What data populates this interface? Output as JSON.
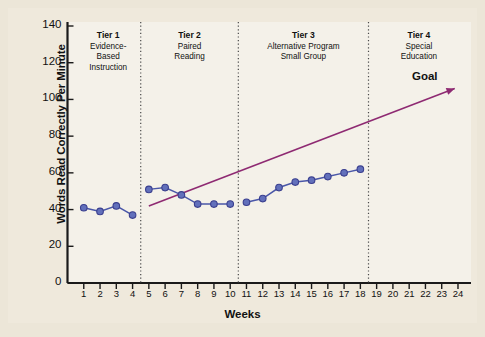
{
  "chart_data": {
    "type": "line",
    "title": "",
    "xlabel": "Weeks",
    "ylabel": "Words Read Correctly Per Minute",
    "xlim": [
      0,
      24.8
    ],
    "ylim": [
      0,
      140
    ],
    "ytick_values": [
      0,
      20,
      40,
      60,
      80,
      100,
      120,
      140
    ],
    "ytick_labels": [
      "0",
      "20",
      "40",
      "60",
      "80",
      "100",
      "120",
      "140"
    ],
    "xtick_values": [
      1,
      2,
      3,
      4,
      5,
      6,
      7,
      8,
      9,
      10,
      11,
      12,
      13,
      14,
      15,
      16,
      17,
      18,
      19,
      20,
      21,
      22,
      23,
      24
    ],
    "xtick_labels": [
      "1",
      "2",
      "3",
      "4",
      "5",
      "6",
      "7",
      "8",
      "9",
      "10",
      "11",
      "12",
      "13",
      "14",
      "15",
      "16",
      "17",
      "18",
      "19",
      "20",
      "21",
      "22",
      "23",
      "24"
    ],
    "grid": false,
    "legend": "none",
    "marker_color": "#6270bb",
    "marker_edge_color": "#3a3f8f",
    "line_color": "#4a57a8",
    "goal_line_color": "#8e2a72",
    "phase_divider_color": "#4a4a4a",
    "series": [
      {
        "name": "Tier 1 Evidence-Based Instruction",
        "x": [
          1,
          2,
          3,
          4
        ],
        "values": [
          41,
          39,
          42,
          37
        ]
      },
      {
        "name": "Tier 2 Paired Reading",
        "x": [
          5,
          6,
          7,
          8,
          9,
          10
        ],
        "values": [
          51,
          52,
          48,
          43,
          43,
          43
        ]
      },
      {
        "name": "Tier 3 Alternative Program Small Group",
        "x": [
          11,
          12,
          13,
          14,
          15,
          16,
          17,
          18
        ],
        "values": [
          44,
          46,
          52,
          55,
          56,
          58,
          60,
          62
        ]
      }
    ],
    "goal_line": {
      "label": "Goal",
      "x_start": 5.0,
      "y_start": 42,
      "x_end": 23.8,
      "y_end": 106,
      "arrow": true
    },
    "phase_dividers": [
      4.5,
      10.5,
      18.5
    ],
    "phases": [
      {
        "name": "Tier 1",
        "description": "Evidence-\nBased\nInstruction",
        "lines": [
          "Evidence-",
          "Based",
          "Instruction"
        ],
        "x_center": 2.5
      },
      {
        "name": "Tier 2",
        "description": "Paired Reading",
        "lines": [
          "Paired",
          "Reading"
        ],
        "x_center": 7.5
      },
      {
        "name": "Tier 3",
        "description": "Alternative Program Small Group",
        "lines": [
          "Alternative Program",
          "Small Group"
        ],
        "x_center": 14.5
      },
      {
        "name": "Tier 4",
        "description": "Special Education",
        "lines": [
          "Special",
          "Education"
        ],
        "x_center": 21.6
      }
    ]
  },
  "colors": {
    "page_background": "#ece6d8",
    "panel_background": "#efe9dc",
    "plot_background": "#f4f1e9",
    "axis": "#1a1a1a",
    "marker": "#6270bb",
    "goal": "#8e2a72"
  }
}
